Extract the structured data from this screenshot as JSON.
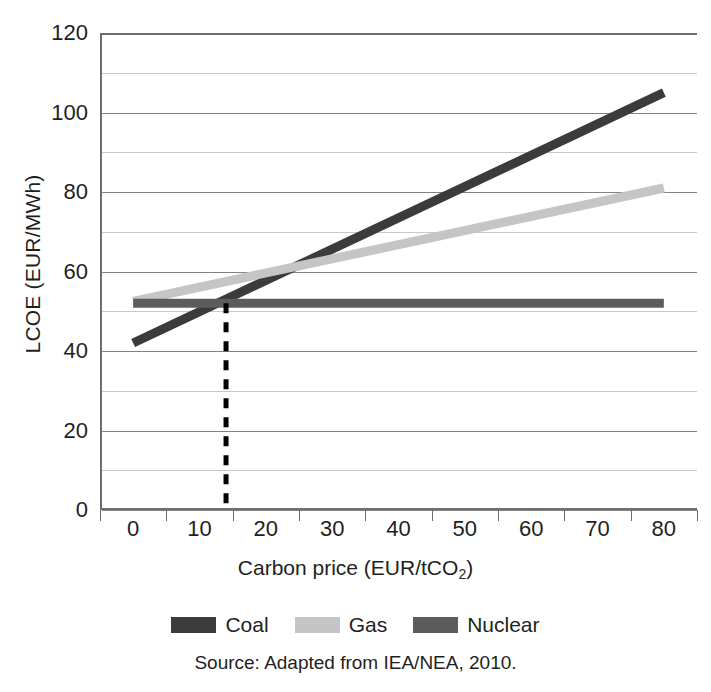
{
  "chart_data": {
    "type": "line",
    "title": "",
    "xlabel": "Carbon price (EUR/tCO2)",
    "xlabel_main": "Carbon price (EUR/tCO",
    "xlabel_sub": "2",
    "xlabel_tail": ")",
    "ylabel": "LCOE (EUR/MWh)",
    "xlim": [
      -5,
      85
    ],
    "ylim": [
      0,
      120
    ],
    "x_ticklabels": [
      "0",
      "10",
      "20",
      "30",
      "40",
      "50",
      "60",
      "70",
      "80"
    ],
    "x_tickvalues": [
      0,
      10,
      20,
      30,
      40,
      50,
      60,
      70,
      80
    ],
    "x_tickmark_values": [
      -5,
      5,
      15,
      25,
      35,
      45,
      55,
      65,
      75,
      85
    ],
    "y_ticklabels": [
      "0",
      "20",
      "40",
      "60",
      "80",
      "100",
      "120"
    ],
    "y_tickvalues": [
      0,
      20,
      40,
      60,
      80,
      100,
      120
    ],
    "y_minor_gridlines": [
      10,
      30,
      50,
      70,
      90,
      110
    ],
    "grid": "horizontal",
    "legend_position": "below-plot",
    "series": [
      {
        "name": "Coal",
        "color": "#3b3b3b",
        "x": [
          0,
          80
        ],
        "values": [
          42,
          105
        ]
      },
      {
        "name": "Gas",
        "color": "#c4c5c7",
        "x": [
          0,
          80
        ],
        "values": [
          52.5,
          81
        ]
      },
      {
        "name": "Nuclear",
        "color": "#5c5c5c",
        "x": [
          0,
          80
        ],
        "values": [
          52,
          52
        ]
      }
    ],
    "annotations": [
      {
        "type": "vertical-dashed-line",
        "name": "breakeven-line",
        "x": 14,
        "y_from": 0,
        "y_to": 52,
        "color": "#000000"
      }
    ]
  },
  "legend": {
    "items": [
      {
        "label": "Coal",
        "color": "#3b3b3b"
      },
      {
        "label": "Gas",
        "color": "#c4c5c7"
      },
      {
        "label": "Nuclear",
        "color": "#5c5c5c"
      }
    ]
  },
  "source": {
    "text": "Source: Adapted from IEA/NEA, 2010."
  },
  "colors": {
    "axis": "#6d6e71",
    "grid_major": "#808285",
    "grid_minor": "#c7c8ca",
    "text": "#231f20"
  }
}
